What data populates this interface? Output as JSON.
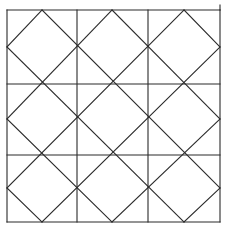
{
  "diagram": {
    "type": "geometric-lattice",
    "stroke_color": "#2a2a2a",
    "background_color": "#ffffff",
    "grid": {
      "rows": 3,
      "cols": 3,
      "x": [
        7,
        77,
        148,
        220
      ],
      "y": [
        10,
        84,
        155,
        222
      ]
    },
    "edge_tick": {
      "x1": 220,
      "y1": 5,
      "x2": 220,
      "y2": 10
    },
    "diagonals_down_right": [
      {
        "x1": 184,
        "y1": 10,
        "x2": 220,
        "y2": 47
      },
      {
        "x1": 112,
        "y1": 10,
        "x2": 220,
        "y2": 119
      },
      {
        "x1": 42,
        "y1": 10,
        "x2": 220,
        "y2": 188
      },
      {
        "x1": 7,
        "y1": 47,
        "x2": 184,
        "y2": 222
      },
      {
        "x1": 7,
        "y1": 119,
        "x2": 112,
        "y2": 222
      },
      {
        "x1": 7,
        "y1": 188,
        "x2": 42,
        "y2": 222
      }
    ],
    "diagonals_up_right": [
      {
        "x1": 7,
        "y1": 47,
        "x2": 42,
        "y2": 10
      },
      {
        "x1": 7,
        "y1": 119,
        "x2": 112,
        "y2": 10
      },
      {
        "x1": 7,
        "y1": 188,
        "x2": 184,
        "y2": 10
      },
      {
        "x1": 42,
        "y1": 222,
        "x2": 220,
        "y2": 47
      },
      {
        "x1": 112,
        "y1": 222,
        "x2": 220,
        "y2": 119
      },
      {
        "x1": 184,
        "y1": 222,
        "x2": 220,
        "y2": 188
      }
    ]
  }
}
